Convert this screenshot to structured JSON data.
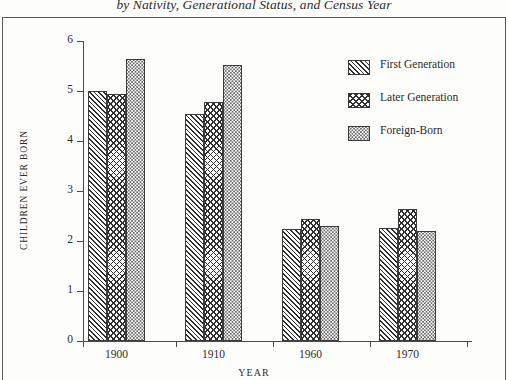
{
  "chart_data": {
    "type": "bar",
    "title": "by Nativity, Generational Status, and Census Year",
    "xlabel": "YEAR",
    "ylabel": "CHILDREN EVER BORN",
    "categories": [
      "1900",
      "1910",
      "1960",
      "1970"
    ],
    "ylim": [
      0,
      6
    ],
    "yticks": [
      0,
      1,
      2,
      3,
      4,
      5,
      6
    ],
    "ytick_labels": [
      "0",
      "1",
      "2",
      "3",
      "4",
      "5",
      "6"
    ],
    "grid": false,
    "legend_position": "upper right",
    "series": [
      {
        "name": "First Generation",
        "pattern": "diagonal-hatch",
        "values": [
          5.0,
          4.55,
          2.25,
          2.27
        ]
      },
      {
        "name": "Later Generation",
        "pattern": "cross-hatch",
        "values": [
          4.95,
          4.78,
          2.45,
          2.65
        ]
      },
      {
        "name": "Foreign-Born",
        "pattern": "stipple-dots",
        "values": [
          5.65,
          5.52,
          2.3,
          2.2
        ]
      }
    ]
  },
  "colors": {
    "ink": "#2b2b2b",
    "axis": "#4a4a4a",
    "bar_outline": "#3a3a3a",
    "background": "#fdfdfc",
    "frame": "#5a5a5a"
  }
}
